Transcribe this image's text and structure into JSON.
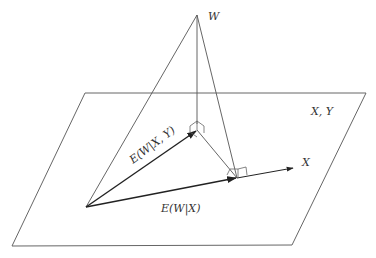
{
  "diagram": {
    "labels": {
      "w": "W",
      "plane": "X, Y",
      "x_axis": "X",
      "e_w_given_xy": "E(W|X, Y)",
      "e_w_given_x": "E(W|X)"
    },
    "points": {
      "origin": [
        86,
        207
      ],
      "W": [
        197,
        15
      ],
      "E_W_XY": [
        197,
        130
      ],
      "E_W_X": [
        237,
        178
      ],
      "X_tip": [
        293,
        168
      ]
    },
    "plane_corners": [
      [
        85,
        93
      ],
      [
        366,
        93
      ],
      [
        292,
        245
      ],
      [
        12,
        246
      ]
    ],
    "colors": {
      "line": "#555555",
      "arrow": "#222222",
      "text": "#333333"
    }
  }
}
